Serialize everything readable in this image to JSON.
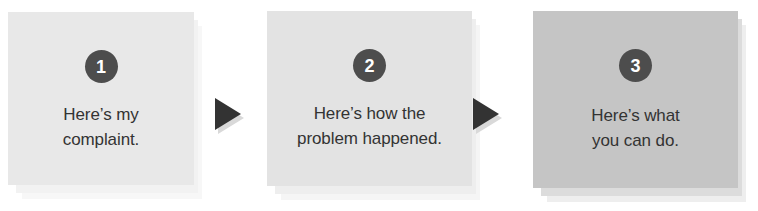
{
  "diagram": {
    "type": "three-step-process-flow",
    "background_color": "#ffffff",
    "badge_color": "#4d4d4d",
    "badge_text_color": "#ffffff",
    "caption_color": "#333333",
    "arrow_color": "#333333",
    "arrow_shadow_color": "#d9d9d9"
  },
  "steps": [
    {
      "number": "1",
      "caption": "Here’s my\ncomplaint.",
      "panel_color": "#e8e8e8",
      "stack_mid_color": "#f2f2f2",
      "stack_back_color": "#f7f7f7",
      "x": 8,
      "y": 12,
      "width": 186,
      "height": 173,
      "badge_top": 38,
      "caption_top": 90
    },
    {
      "number": "2",
      "caption": "Here’s how the\nproblem happened.",
      "panel_color": "#e3e3e3",
      "stack_mid_color": "#eeeeee",
      "stack_back_color": "#f5f5f5",
      "x": 267,
      "y": 11,
      "width": 205,
      "height": 175,
      "badge_top": 38,
      "caption_top": 90
    },
    {
      "number": "3",
      "caption": "Here’s what\nyou can do.",
      "panel_color": "#c5c5c5",
      "stack_mid_color": "#dcdcdc",
      "stack_back_color": "#eeeeee",
      "x": 533,
      "y": 11,
      "width": 205,
      "height": 177,
      "badge_top": 38,
      "caption_top": 92
    }
  ],
  "arrows": [
    {
      "label": "step-1-to-step-2",
      "x": 212,
      "y": 95,
      "width": 34,
      "height": 40
    },
    {
      "label": "step-2-to-step-3",
      "x": 470,
      "y": 95,
      "width": 34,
      "height": 40
    }
  ]
}
